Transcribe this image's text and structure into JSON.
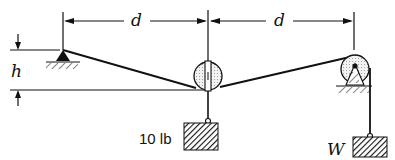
{
  "diagram": {
    "type": "statics-pulley-cable",
    "labels": {
      "dim_left": "d",
      "dim_right": "d",
      "height": "h",
      "weight_center": "10 lb",
      "weight_right": "W"
    },
    "elements": [
      {
        "name": "pin-support-left",
        "kind": "fixed pin support"
      },
      {
        "name": "pulley-center",
        "kind": "free pulley with hanging 10 lb block"
      },
      {
        "name": "pulley-right",
        "kind": "fixed pulley on support"
      },
      {
        "name": "cable",
        "kind": "cable from pin over pulleys to W"
      },
      {
        "name": "block-10lb",
        "kind": "hanging weight"
      },
      {
        "name": "block-w",
        "kind": "hanging weight"
      }
    ],
    "colors": {
      "ink": "#111111",
      "pulley_fill": "#e8e8e8",
      "background": "#ffffff"
    }
  }
}
